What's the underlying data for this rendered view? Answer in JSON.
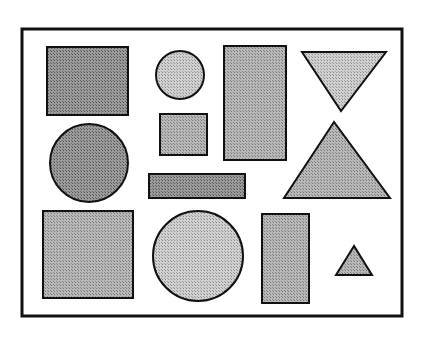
{
  "figure": {
    "background": "#ffffff",
    "frame": {
      "x": 22,
      "y": 29,
      "w": 380,
      "h": 287,
      "stroke": "#111111",
      "stroke_width": 3
    },
    "fills": {
      "dark": "#8a8a8a",
      "medium": "#a9a9a9",
      "light": "#c4c4c4"
    },
    "shapes": [
      {
        "id": "dark-square",
        "type": "rect",
        "x": 47,
        "y": 47,
        "w": 81,
        "h": 68,
        "shade": "dark"
      },
      {
        "id": "small-circle",
        "type": "circle",
        "cx": 180,
        "cy": 75,
        "r": 24,
        "shade": "light"
      },
      {
        "id": "tall-rectangle",
        "type": "rect",
        "x": 224,
        "y": 46,
        "w": 62,
        "h": 114,
        "shade": "medium"
      },
      {
        "id": "inverted-triangle",
        "type": "polygon",
        "points": "302,52 386,52 341,111",
        "shade": "light"
      },
      {
        "id": "medium-circle",
        "type": "circle",
        "cx": 89,
        "cy": 163,
        "r": 39,
        "shade": "dark"
      },
      {
        "id": "small-square",
        "type": "rect",
        "x": 160,
        "y": 114,
        "w": 47,
        "h": 41,
        "shade": "medium"
      },
      {
        "id": "large-triangle",
        "type": "polygon",
        "points": "334,122 284,198 390,198",
        "shade": "medium"
      },
      {
        "id": "thin-bar",
        "type": "rect",
        "x": 149,
        "y": 174,
        "w": 96,
        "h": 24,
        "shade": "dark"
      },
      {
        "id": "large-square",
        "type": "rect",
        "x": 43,
        "y": 211,
        "w": 90,
        "h": 87,
        "shade": "medium"
      },
      {
        "id": "large-circle",
        "type": "circle",
        "cx": 198,
        "cy": 256,
        "r": 45,
        "shade": "light"
      },
      {
        "id": "bottom-rectangle",
        "type": "rect",
        "x": 262,
        "y": 214,
        "w": 47,
        "h": 89,
        "shade": "medium"
      },
      {
        "id": "small-triangle",
        "type": "polygon",
        "points": "354,246 336,275 372,275",
        "shade": "medium"
      }
    ]
  }
}
